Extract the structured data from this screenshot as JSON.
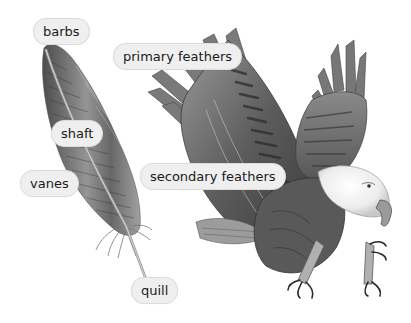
{
  "diagram": {
    "subjects": [
      {
        "name": "feather",
        "description": "single bird feather illustration"
      },
      {
        "name": "eagle",
        "description": "bald eagle diving with wings raised and talons extended"
      }
    ],
    "labels": [
      {
        "id": "barbs",
        "text": "barbs",
        "x": 33,
        "y": 18
      },
      {
        "id": "primary-feathers",
        "text": "primary feathers",
        "x": 113,
        "y": 43
      },
      {
        "id": "shaft",
        "text": "shaft",
        "x": 51,
        "y": 120
      },
      {
        "id": "secondary-feathers",
        "text": "secondary feathers",
        "x": 140,
        "y": 163
      },
      {
        "id": "vanes",
        "text": "vanes",
        "x": 20,
        "y": 170
      },
      {
        "id": "quill",
        "text": "quill",
        "x": 131,
        "y": 277
      }
    ],
    "colors": {
      "background": "#ffffff",
      "label_fill": "#efefef",
      "label_border": "#dcdcdc",
      "label_text": "#1a1a1a",
      "ink_dark": "#3a3a3a",
      "ink_mid": "#7a7a7a",
      "ink_light": "#b5b5b5"
    }
  }
}
